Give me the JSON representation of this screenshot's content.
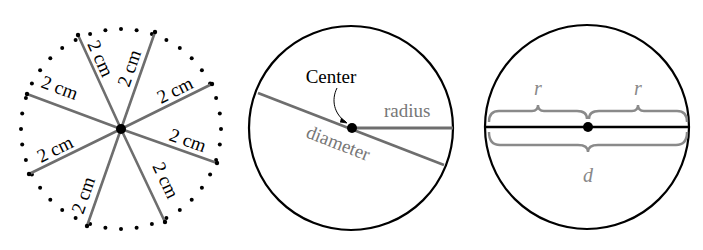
{
  "figures": [
    {
      "id": "radii-figure",
      "labels": [
        "2 cm",
        "2 cm",
        "2 cm",
        "2 cm",
        "2 cm",
        "2 cm",
        "2 cm",
        "2 cm"
      ]
    },
    {
      "id": "parts-figure",
      "center_label": "Center",
      "radius_label": "radius",
      "diameter_label": "diameter"
    },
    {
      "id": "r-d-figure",
      "r_left": "r",
      "r_right": "r",
      "d_label": "d"
    }
  ],
  "colors": {
    "ink": "#000000",
    "gray_line": "#6e6e6e",
    "gray_text": "#777777",
    "brace": "#8a8a8a"
  }
}
